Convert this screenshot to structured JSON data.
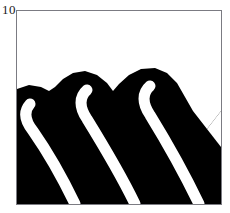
{
  "panel": {
    "label": "10",
    "frame": {
      "border_color": "#7b7b82",
      "background_color": "#ffffff",
      "x": 16,
      "y": 10,
      "width": 206,
      "height": 195
    }
  },
  "figure": {
    "title": "10",
    "type": "binary-silhouette-image",
    "foreground_color": "#000000",
    "background_color": "#ffffff",
    "viewbox": "0 0 204 193",
    "silhouette_path": "M 0 78 L 0 193 L 204 193 L 204 193 L 204 100 L 190 118 L 176 100 L 168 86 L 160 72 L 150 62 L 138 57 L 124 58 L 112 64 L 102 73 L 96 80 L 90 72 L 80 64 L 68 60 L 56 62 L 46 68 L 38 76 L 32 80 L 24 76 L 12 74 L 0 78 Z",
    "stripes": [
      {
        "name": "stripe-1",
        "tip_x": 13,
        "tip_y": 93,
        "bottom_x": 58,
        "bottom_y": 193,
        "width": 11,
        "path": "M 13 93 C 6 101 8 110 16 120 C 30 140 46 168 58 193"
      },
      {
        "name": "stripe-2",
        "tip_x": 70,
        "tip_y": 79,
        "bottom_x": 118,
        "bottom_y": 193,
        "width": 11,
        "path": "M 70 79 C 62 86 62 96 70 108 C 86 134 106 168 118 193"
      },
      {
        "name": "stripe-3",
        "tip_x": 133,
        "tip_y": 75,
        "bottom_x": 182,
        "bottom_y": 193,
        "width": 11,
        "path": "M 133 75 C 125 82 125 92 133 104 C 149 130 170 168 182 193"
      },
      {
        "name": "stripe-4-partial",
        "tip_x": 196,
        "tip_y": 112,
        "bottom_x": 204,
        "bottom_y": 150,
        "width": 11,
        "path": "M 200 100 L 204 112"
      }
    ],
    "right_wedge_path": "M 204 100 L 190 118 L 204 136 Z"
  }
}
